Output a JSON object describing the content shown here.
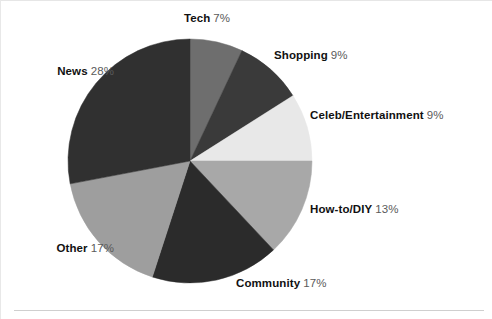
{
  "chart_data": {
    "type": "pie",
    "title": "",
    "subtitle": "",
    "xlabel": "",
    "ylabel": "",
    "legend_position": "none",
    "grid": false,
    "units": "percent",
    "start_angle_deg": 0,
    "direction": "clockwise",
    "categories": [
      "Tech",
      "Shopping",
      "Celeb/Entertainment",
      "How-to/DIY",
      "Community",
      "Other",
      "News"
    ],
    "values": [
      7,
      9,
      9,
      13,
      17,
      17,
      28
    ],
    "slices": [
      {
        "label": "Tech",
        "value": 7,
        "value_text": "7%",
        "color": "#6e6e6e"
      },
      {
        "label": "Shopping",
        "value": 9,
        "value_text": "9%",
        "color": "#3a3a3a"
      },
      {
        "label": "Celeb/Entertainment",
        "value": 9,
        "value_text": "9%",
        "color": "#e8e8e8"
      },
      {
        "label": "How-to/DIY",
        "value": 13,
        "value_text": "13%",
        "color": "#a8a8a8"
      },
      {
        "label": "Community",
        "value": 17,
        "value_text": "17%",
        "color": "#2b2b2b"
      },
      {
        "label": "Other",
        "value": 17,
        "value_text": "17%",
        "color": "#9e9e9e"
      },
      {
        "label": "News",
        "value": 28,
        "value_text": "28%",
        "color": "#303030"
      }
    ]
  },
  "labels": {
    "tech": {
      "name": "Tech",
      "value": "7%"
    },
    "shopping": {
      "name": "Shopping",
      "value": "9%"
    },
    "celeb": {
      "name": "Celeb/Entertainment",
      "value": "9%"
    },
    "howto": {
      "name": "How-to/DIY",
      "value": "13%"
    },
    "community": {
      "name": "Community",
      "value": "17%"
    },
    "other": {
      "name": "Other",
      "value": "17%"
    },
    "news": {
      "name": "News",
      "value": "28%"
    }
  },
  "geometry": {
    "center_x": 190,
    "center_y": 161,
    "radius": 122
  },
  "colors": {
    "background": "#ffffff",
    "label_name": "#111111",
    "label_value": "#5a5a5a"
  }
}
